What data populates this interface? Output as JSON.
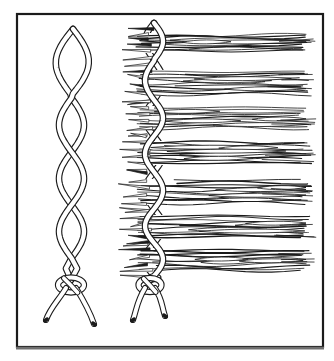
{
  "figure": {
    "colors": {
      "background": "#ffffff",
      "ink": "#1b1b1b",
      "paper": "#ffffff",
      "frame_shadow": "#6f6f6f"
    },
    "frame": {
      "x": 17,
      "y": 14,
      "width": 306,
      "height": 333,
      "stroke_width": 2.2
    },
    "stroke": {
      "cord_outer": 6.6,
      "cord_inner": 4.3,
      "grass": 0.9
    },
    "left_cord": {
      "center_x": 71.5,
      "amplitude": 12.5,
      "loop": {
        "apex_x": 73,
        "apex_y": 29,
        "half_width": 16.5,
        "bottom_y": 98
      },
      "crossings": [
        98,
        152,
        205,
        258
      ],
      "knot": {
        "x": 71,
        "y": 285,
        "rx": 13,
        "ry": 7.5
      },
      "legs": [
        {
          "tip_x": 46,
          "tip_y": 320
        },
        {
          "tip_x": 94,
          "tip_y": 324
        }
      ]
    },
    "right_cord": {
      "center_x": 154,
      "amplitude": 9,
      "loop": {
        "apex_x": 154,
        "apex_y": 23,
        "half_width": 9,
        "bottom_y": 61
      },
      "crossings": [
        61,
        100,
        136,
        172,
        209,
        243,
        276
      ],
      "knot": {
        "x": 150,
        "y": 285,
        "rx": 11.5,
        "ry": 7
      },
      "legs": [
        {
          "tip_x": 133,
          "tip_y": 320
        },
        {
          "tip_x": 165,
          "tip_y": 316
        }
      ]
    },
    "bundles": {
      "centers_y": [
        43,
        83,
        118,
        153,
        192,
        227,
        260
      ],
      "half_heights": [
        10,
        13,
        12,
        12,
        13,
        12,
        12
      ],
      "body_left_x": 136,
      "fray_left_x": 118,
      "right_x": 312
    }
  }
}
